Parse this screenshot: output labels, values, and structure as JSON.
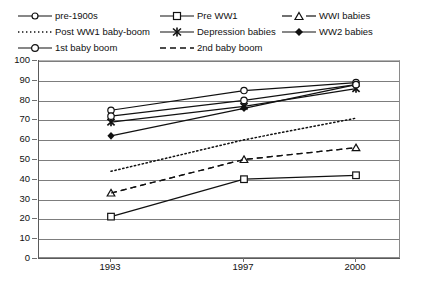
{
  "title_sliver": "",
  "legend": {
    "position": "top",
    "entries": [
      {
        "label": "pre-1900s",
        "style": "solid",
        "marker": "circle-open",
        "color": "#111111"
      },
      {
        "label": "Pre WW1",
        "style": "solid",
        "marker": "square-open",
        "color": "#111111"
      },
      {
        "label": "WWI babies",
        "style": "dashed",
        "marker": "triangle-open",
        "color": "#111111"
      },
      {
        "label": "Post WW1 baby-boom",
        "style": "dotted",
        "marker": "none",
        "color": "#111111"
      },
      {
        "label": "Depression babies",
        "style": "solid",
        "marker": "star-filled",
        "color": "#111111"
      },
      {
        "label": "WW2 babies",
        "style": "solid",
        "marker": "diamond-filled",
        "color": "#111111"
      },
      {
        "label": "1st baby boom",
        "style": "solid",
        "marker": "circle-open",
        "color": "#111111"
      },
      {
        "label": "2nd baby boom",
        "style": "dashed",
        "marker": "none",
        "color": "#111111"
      }
    ]
  },
  "axes": {
    "y_ticks": [
      "100",
      "90",
      "80",
      "70",
      "60",
      "50",
      "40",
      "30",
      "20",
      "10",
      "0"
    ],
    "x_ticks": [
      "1993",
      "1997",
      "2000"
    ],
    "ylim": [
      0,
      100
    ],
    "ylabel": "",
    "xlabel": ""
  },
  "chart_data": {
    "type": "line",
    "title": "",
    "xlabel": "",
    "ylabel": "",
    "ylim": [
      0,
      100
    ],
    "grid": true,
    "legend_position": "top",
    "categories": [
      "1993",
      "1997",
      "2000"
    ],
    "series": [
      {
        "name": "pre-1900s",
        "values": [
          75,
          85,
          89
        ],
        "style": "solid",
        "marker": "circle-open"
      },
      {
        "name": "Pre WW1",
        "values": [
          21,
          40,
          42
        ],
        "style": "solid",
        "marker": "square-open"
      },
      {
        "name": "WWI babies",
        "values": [
          33,
          50,
          56
        ],
        "style": "dashed",
        "marker": "triangle-open"
      },
      {
        "name": "Post WW1 baby-boom",
        "values": [
          44,
          60,
          71
        ],
        "style": "dotted",
        "marker": "none"
      },
      {
        "name": "Depression babies",
        "values": [
          69,
          77,
          86
        ],
        "style": "solid",
        "marker": "star-filled"
      },
      {
        "name": "WW2 babies",
        "values": [
          62,
          76,
          88
        ],
        "style": "solid",
        "marker": "diamond-filled"
      },
      {
        "name": "1st baby boom",
        "values": [
          72,
          80,
          88
        ],
        "style": "solid",
        "marker": "circle-open"
      },
      {
        "name": "2nd baby boom",
        "values": [
          33,
          50,
          56
        ],
        "style": "dashed",
        "marker": "none"
      }
    ]
  }
}
